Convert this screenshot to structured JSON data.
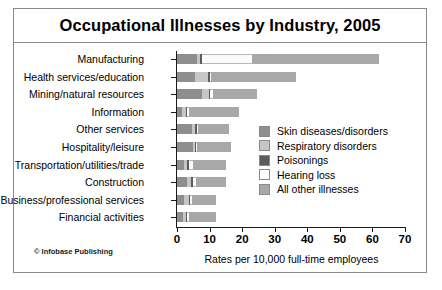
{
  "chart_data": {
    "type": "bar",
    "orientation": "horizontal",
    "stacked": true,
    "title": "Occupational Illnesses by Industry, 2005",
    "xlabel": "Rates per 10,000 full-time employees",
    "ylabel": "",
    "xlim": [
      0,
      70
    ],
    "xticks": [
      0,
      10,
      20,
      30,
      40,
      50,
      60,
      70
    ],
    "grid": false,
    "legend_position": "inside-right",
    "categories": [
      "Manufacturing",
      "Health services/education",
      "Mining/natural resources",
      "Information",
      "Other services",
      "Hospitality/leisure",
      "Transportation/utilities/trade",
      "Construction",
      "Business/professional services",
      "Financial activities"
    ],
    "series": [
      {
        "name": "Skin diseases/disorders",
        "color": "#8e8e8e",
        "values": [
          6.0,
          5.6,
          7.8,
          1.6,
          4.6,
          4.8,
          2.0,
          3.0,
          2.2,
          1.8
        ]
      },
      {
        "name": "Respiratory disorders",
        "color": "#c6c6c6",
        "values": [
          1.2,
          4.0,
          2.0,
          1.2,
          1.0,
          0.8,
          1.2,
          1.4,
          1.4,
          1.0
        ]
      },
      {
        "name": "Poisonings",
        "color": "#5c5c5c",
        "values": [
          0.4,
          0.5,
          0.4,
          0.4,
          0.5,
          0.3,
          0.4,
          0.5,
          0.5,
          0.4
        ]
      },
      {
        "name": "Hearing loss",
        "color": "#fbfbfb",
        "values": [
          15.4,
          0.4,
          1.0,
          0.6,
          0.4,
          0.3,
          1.4,
          0.8,
          0.5,
          0.4
        ]
      },
      {
        "name": "All other illnesses",
        "color": "#a8a8a8",
        "values": [
          39.0,
          26.0,
          13.3,
          15.2,
          9.5,
          10.3,
          10.0,
          9.3,
          7.4,
          8.4
        ]
      }
    ],
    "totals": [
      62.0,
      36.5,
      24.5,
      19.0,
      16.0,
      16.5,
      15.0,
      15.0,
      12.0,
      12.0
    ]
  },
  "legend": {
    "items": [
      {
        "label": "Skin diseases/disorders",
        "color": "#8e8e8e"
      },
      {
        "label": "Respiratory disorders",
        "color": "#c6c6c6"
      },
      {
        "label": "Poisonings",
        "color": "#5c5c5c"
      },
      {
        "label": "Hearing loss",
        "color": "#ffffff"
      },
      {
        "label": "All other illnesses",
        "color": "#a8a8a8"
      }
    ]
  },
  "credit": "© Infobase Publishing"
}
